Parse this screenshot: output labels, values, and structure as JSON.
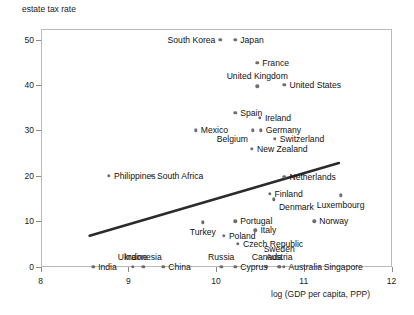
{
  "chart_data": {
    "type": "scatter",
    "title": "",
    "ylabel": "estate tax rate",
    "xlabel": "log (GDP per capita, PPP)",
    "xlim": [
      8,
      12
    ],
    "ylim": [
      0,
      52
    ],
    "xticks": [
      8,
      9,
      10,
      11,
      12
    ],
    "yticks": [
      0,
      10,
      20,
      30,
      40,
      50
    ],
    "grid": false,
    "legend": null,
    "trendline": {
      "type": "linear",
      "x_start": 8.56,
      "y_start": 6.8,
      "x_end": 11.4,
      "y_end": 22.8
    },
    "points": [
      {
        "name": "South Korea",
        "x": 10.05,
        "y": 50.0,
        "label_side": "left"
      },
      {
        "name": "Japan",
        "x": 10.22,
        "y": 50.0,
        "label_side": "right"
      },
      {
        "name": "France",
        "x": 10.47,
        "y": 44.9,
        "label_side": "right"
      },
      {
        "name": "United Kingdom",
        "x": 10.47,
        "y": 39.7,
        "label_side": "above"
      },
      {
        "name": "United States",
        "x": 10.78,
        "y": 40.0,
        "label_side": "right"
      },
      {
        "name": "Spain",
        "x": 10.22,
        "y": 33.9,
        "label_side": "right"
      },
      {
        "name": "Ireland",
        "x": 10.5,
        "y": 32.8,
        "label_side": "right"
      },
      {
        "name": "Mexico",
        "x": 9.77,
        "y": 30.0,
        "label_side": "right"
      },
      {
        "name": "Germany",
        "x": 10.51,
        "y": 30.0,
        "label_side": "right"
      },
      {
        "name": "Belgium",
        "x": 10.42,
        "y": 30.0,
        "label_side": "below-left"
      },
      {
        "name": "Switzerland",
        "x": 10.67,
        "y": 28.1,
        "label_side": "right"
      },
      {
        "name": "New Zealand",
        "x": 10.41,
        "y": 25.9,
        "label_side": "right"
      },
      {
        "name": "Philippines",
        "x": 8.78,
        "y": 20.0,
        "label_side": "right"
      },
      {
        "name": "South Africa",
        "x": 9.27,
        "y": 20.0,
        "label_side": "right"
      },
      {
        "name": "Netherlands",
        "x": 10.78,
        "y": 19.7,
        "label_side": "right"
      },
      {
        "name": "Finland",
        "x": 10.61,
        "y": 16.0,
        "label_side": "right"
      },
      {
        "name": "Denmark",
        "x": 10.66,
        "y": 14.8,
        "label_side": "right-below"
      },
      {
        "name": "Luxembourg",
        "x": 11.42,
        "y": 15.7,
        "label_side": "below"
      },
      {
        "name": "Turkey",
        "x": 9.85,
        "y": 9.7,
        "label_side": "below"
      },
      {
        "name": "Portugal",
        "x": 10.22,
        "y": 10.0,
        "label_side": "right"
      },
      {
        "name": "Norway",
        "x": 11.12,
        "y": 10.0,
        "label_side": "right"
      },
      {
        "name": "Italy",
        "x": 10.45,
        "y": 8.0,
        "label_side": "right"
      },
      {
        "name": "Poland",
        "x": 10.09,
        "y": 6.8,
        "label_side": "right"
      },
      {
        "name": "Czech Republic",
        "x": 10.25,
        "y": 5.0,
        "label_side": "right"
      },
      {
        "name": "Russia",
        "x": 10.06,
        "y": 0.0,
        "label_side": "above"
      },
      {
        "name": "Canada",
        "x": 10.58,
        "y": 0.0,
        "label_side": "above"
      },
      {
        "name": "Sweden",
        "x": 10.72,
        "y": 0.0,
        "label_side": "above2"
      },
      {
        "name": "Austria",
        "x": 10.72,
        "y": 0.0,
        "label_side": "above"
      },
      {
        "name": "Cyprus",
        "x": 10.22,
        "y": 0.0,
        "label_side": "right"
      },
      {
        "name": "Australia",
        "x": 10.77,
        "y": 0.0,
        "label_side": "right"
      },
      {
        "name": "Singapore",
        "x": 11.17,
        "y": 0.0,
        "label_side": "right"
      },
      {
        "name": "India",
        "x": 8.6,
        "y": 0.0,
        "label_side": "right"
      },
      {
        "name": "Ukraine",
        "x": 9.05,
        "y": 0.0,
        "label_side": "above"
      },
      {
        "name": "Indonesia",
        "x": 9.17,
        "y": 0.0,
        "label_side": "above"
      },
      {
        "name": "China",
        "x": 9.4,
        "y": 0.0,
        "label_side": "right"
      }
    ]
  },
  "axis": {
    "y_title": "estate tax rate",
    "x_title": "log (GDP per capita, PPP)",
    "y_ticks": [
      "50",
      "40",
      "30",
      "20",
      "10",
      "0"
    ],
    "x_ticks": [
      "8",
      "9",
      "10",
      "11",
      "12"
    ]
  },
  "colors": {
    "dot": "#6e6e6e",
    "line": "#2b2b2b",
    "frame": "#b9b9b9",
    "text": "#121212"
  },
  "labels": {
    "south_korea": "South Korea",
    "japan": "Japan",
    "france": "France",
    "united_kingdom": "United Kingdom",
    "united_states": "United States",
    "spain": "Spain",
    "ireland": "Ireland",
    "mexico": "Mexico",
    "germany": "Germany",
    "belgium": "Belgium",
    "switzerland": "Switzerland",
    "new_zealand": "New Zealand",
    "philippines": "Philippines",
    "south_africa": "South Africa",
    "netherlands": "Netherlands",
    "finland": "Finland",
    "denmark": "Denmark",
    "luxembourg": "Luxembourg",
    "turkey": "Turkey",
    "portugal": "Portugal",
    "norway": "Norway",
    "italy": "Italy",
    "poland": "Poland",
    "czech_republic": "Czech Republic",
    "russia": "Russia",
    "canada": "Canada",
    "sweden": "Sweden",
    "austria": "Austria",
    "cyprus": "Cyprus",
    "australia": "Australia",
    "singapore": "Singapore",
    "india": "India",
    "ukraine": "Ukraine",
    "indonesia": "Indonesia",
    "china": "China"
  }
}
